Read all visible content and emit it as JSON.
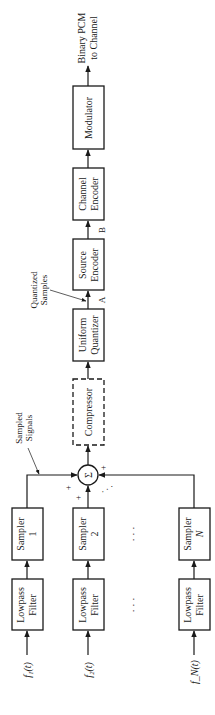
{
  "output": {
    "line1": "Binary PCM",
    "line2": "to Channel"
  },
  "blocks": {
    "modulator": "Modulator",
    "channel_encoder": [
      "Channel",
      "Encoder"
    ],
    "source_encoder": [
      "Source",
      "Encoder"
    ],
    "uniform_quantizer": [
      "Uniform",
      "Quantizer"
    ],
    "compressor": "Compressor",
    "summer_symbol": "Σ"
  },
  "annotations": {
    "point_a": "A",
    "point_b": "B",
    "quantized_samples": [
      "Quantized",
      "Samples"
    ],
    "sampled_signals": [
      "Sampled",
      "Signals"
    ],
    "plus": "+",
    "ellipsis": "· · ·"
  },
  "channels": [
    {
      "sampler": [
        "Sampler",
        "1"
      ],
      "filter": [
        "Lowpass",
        "Filter"
      ],
      "input": "f₁(t)"
    },
    {
      "sampler": [
        "Sampler",
        "2"
      ],
      "filter": [
        "Lowpass",
        "Filter"
      ],
      "input": "f₂(t)"
    },
    {
      "sampler": [
        "Sampler",
        "N"
      ],
      "filter": [
        "Lowpass",
        "Filter"
      ],
      "input": "f_N(t)"
    }
  ]
}
